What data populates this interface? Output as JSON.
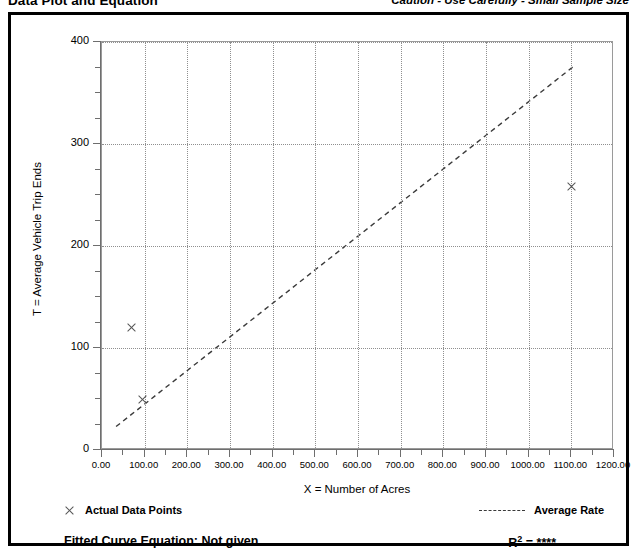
{
  "header": {
    "title": "Data Plot and Equation",
    "caution": "Caution - Use Carefully - Small Sample Size"
  },
  "legend": {
    "data_points_label": "Actual Data Points",
    "average_rate_label": "Average Rate",
    "marker_icon": "x-marker-icon",
    "line_icon": "dashed-line-icon"
  },
  "equation": {
    "fitted_label": "Fitted Curve Equation:  Not given",
    "r_squared_base": "R",
    "r_squared_exp": "2",
    "r_squared_value": "= ****"
  },
  "colors": {
    "frame": "#000000",
    "grid": "#8f8f8f",
    "axis": "#6e6e6e",
    "marker": "#555555",
    "trend": "#3a3a3a"
  },
  "chart_data": {
    "type": "scatter",
    "title": "Data Plot and Equation",
    "subtitle": "Caution - Use Carefully - Small Sample Size",
    "xlabel": "X = Number of Acres",
    "ylabel": "T = Average Vehicle Trip Ends",
    "xlim": [
      0,
      1200
    ],
    "ylim": [
      0,
      400
    ],
    "xticks": [
      0,
      100,
      200,
      300,
      400,
      500,
      600,
      700,
      800,
      900,
      1000,
      1100,
      1200
    ],
    "xticklabels": [
      "0.00",
      "100.00",
      "200.00",
      "300.00",
      "400.00",
      "500.00",
      "600.00",
      "700.00",
      "800.00",
      "900.00",
      "1000.00",
      "1100.00",
      "1200.00"
    ],
    "yticks": [
      0,
      100,
      200,
      300,
      400
    ],
    "yticklabels": [
      "0",
      "100",
      "200",
      "300",
      "400"
    ],
    "y_minor_tick_step": 25,
    "grid": true,
    "grid_style": "dotted",
    "legend_position": "below-axes",
    "series": [
      {
        "name": "Actual Data Points",
        "type": "scatter",
        "marker": "x",
        "points": [
          {
            "x": 70,
            "y": 120
          },
          {
            "x": 95,
            "y": 50
          },
          {
            "x": 1100,
            "y": 258
          }
        ]
      },
      {
        "name": "Average Rate",
        "type": "line",
        "style": "dashed",
        "points": [
          {
            "x": 33,
            "y": 23
          },
          {
            "x": 1105,
            "y": 376
          }
        ],
        "slope": 0.329,
        "equation_note": "Not given",
        "r_squared": "****"
      }
    ]
  }
}
